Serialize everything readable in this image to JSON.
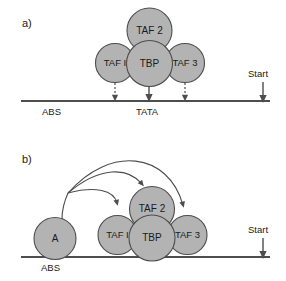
{
  "figure": {
    "type": "schematic-diagram",
    "width": 286,
    "height": 281,
    "background": "#ffffff",
    "node_fill": "#b3b3b3",
    "node_stroke": "#4d4d4d",
    "line_color": "#4d4d4d"
  },
  "panels": [
    {
      "id": "panel-a",
      "label": "a)",
      "nodes": [
        {
          "id": "taf2",
          "label": "TAF 2",
          "cx": 149.5,
          "cy": 30.5,
          "r": 22.5
        },
        {
          "id": "taf1",
          "label": "TAF I",
          "cx": 115.0,
          "cy": 63.0,
          "r": 19.5
        },
        {
          "id": "tbp",
          "label": "TBP",
          "cx": 149.5,
          "cy": 63.5,
          "r": 23.0
        },
        {
          "id": "taf3",
          "label": "TAF 3",
          "cx": 185.0,
          "cy": 63.0,
          "r": 19.5
        }
      ],
      "baseline": {
        "y": 101,
        "x1": 21,
        "x2": 270
      },
      "axis_labels": [
        {
          "id": "abs",
          "text": "ABS",
          "x": 42,
          "y": 115
        },
        {
          "id": "tata",
          "text": "TATA",
          "x": 136,
          "y": 115
        }
      ],
      "start": {
        "label": "Start",
        "text_x": 248,
        "text_y": 77,
        "arrow_x": 263,
        "arrow_y1": 82,
        "arrow_y2": 100
      },
      "arrows": [
        {
          "id": "arrow-taf1",
          "style": "dotted",
          "x": 115,
          "y1": 83,
          "y2": 99
        },
        {
          "id": "arrow-tbp",
          "style": "solid",
          "x": 149,
          "y1": 83,
          "y2": 99
        },
        {
          "id": "arrow-taf3",
          "style": "dotted",
          "x": 185,
          "y1": 83,
          "y2": 99
        }
      ]
    },
    {
      "id": "panel-b",
      "label": "b)",
      "nodes": [
        {
          "id": "activator",
          "label": "A",
          "cx": 55.0,
          "cy": 238.5,
          "r": 21.0
        },
        {
          "id": "taf2",
          "label": "TAF 2",
          "cx": 152.0,
          "cy": 209.0,
          "r": 22.5
        },
        {
          "id": "taf1",
          "label": "TAF I",
          "cx": 117.5,
          "cy": 235.0,
          "r": 19.5
        },
        {
          "id": "tbp",
          "label": "TBP",
          "cx": 152.0,
          "cy": 238.0,
          "r": 23.0
        },
        {
          "id": "taf3",
          "label": "TAF 3",
          "cx": 187.5,
          "cy": 235.0,
          "r": 19.5
        }
      ],
      "baseline": {
        "y": 257,
        "x1": 21,
        "x2": 270
      },
      "axis_labels": [
        {
          "id": "abs",
          "text": "ABS",
          "x": 41,
          "y": 271
        }
      ],
      "start": {
        "label": "Start",
        "text_x": 248,
        "text_y": 233,
        "arrow_x": 263,
        "arrow_y1": 238,
        "arrow_y2": 256
      },
      "recruit_arrows": [
        {
          "id": "recruit-taf1",
          "from": "activator",
          "to": "taf1",
          "path": "M 68 193 C 95 186 114 190 117 203"
        },
        {
          "id": "recruit-taf2",
          "from": "activator",
          "to": "taf2",
          "path": "M 68 193 C 100 166 128 167 142 184"
        },
        {
          "id": "recruit-taf3",
          "from": "activator",
          "to": "taf3",
          "path": "M 68 193 C 110 145 168 152 183 205"
        }
      ]
    }
  ]
}
